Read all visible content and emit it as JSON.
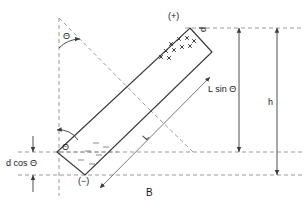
{
  "figure": {
    "caption": "B",
    "background_color": "#ffffff",
    "line_color": "#3a3a3a",
    "dash_color": "#8a8a8a",
    "text_color": "#1a1a1a",
    "labels": {
      "positive_end": "(+)",
      "negative_end": "(−)",
      "thickness": "d",
      "length": "L",
      "angle_top": "Θ",
      "angle_bottom": "Θ",
      "vertical_projection": "L sin Θ",
      "height": "h",
      "offset": "d cos Θ"
    },
    "charges": {
      "positive_symbol": "+",
      "positive_count": 10,
      "negative_symbol": "−",
      "negative_count": 6
    }
  }
}
